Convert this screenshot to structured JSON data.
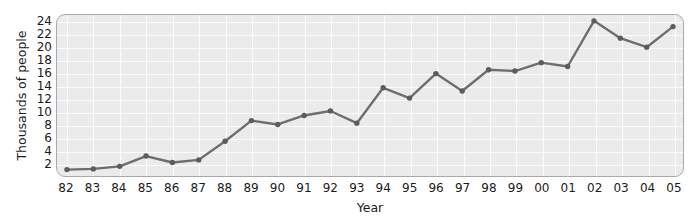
{
  "chart_data": {
    "type": "line",
    "title": "",
    "xlabel": "Year",
    "ylabel": "Thousands of people",
    "x_tick_labels": [
      "82",
      "83",
      "84",
      "85",
      "86",
      "87",
      "88",
      "89",
      "90",
      "91",
      "92",
      "93",
      "94",
      "95",
      "96",
      "97",
      "98",
      "99",
      "00",
      "01",
      "02",
      "03",
      "04",
      "05"
    ],
    "y_tick_labels": [
      "24",
      "22",
      "20",
      "18",
      "16",
      "14",
      "12",
      "10",
      "8",
      "6",
      "4",
      "2"
    ],
    "y_ticks": [
      24,
      22,
      20,
      18,
      16,
      14,
      12,
      10,
      8,
      6,
      4,
      2
    ],
    "ylim": [
      0,
      25
    ],
    "xlim": [
      0,
      23
    ],
    "grid": true,
    "legend": "none",
    "categories": [
      "82",
      "83",
      "84",
      "85",
      "86",
      "87",
      "88",
      "89",
      "90",
      "91",
      "92",
      "93",
      "94",
      "95",
      "96",
      "97",
      "98",
      "99",
      "00",
      "01",
      "02",
      "03",
      "04",
      "05"
    ],
    "values": [
      1.0,
      1.1,
      1.5,
      3.1,
      2.1,
      2.5,
      5.4,
      8.6,
      8.0,
      9.4,
      10.1,
      8.2,
      13.7,
      12.1,
      15.9,
      13.2,
      16.5,
      16.3,
      17.6,
      17.0,
      24.1,
      21.4,
      20.0,
      23.2
    ],
    "series": [
      {
        "name": "Thousands of people",
        "values": [
          1.0,
          1.1,
          1.5,
          3.1,
          2.1,
          2.5,
          5.4,
          8.6,
          8.0,
          9.4,
          10.1,
          8.2,
          13.7,
          12.1,
          15.9,
          13.2,
          16.5,
          16.3,
          17.6,
          17.0,
          24.1,
          21.4,
          20.0,
          23.2
        ],
        "color": "#6e6e6e",
        "marker": "circle"
      }
    ]
  },
  "style": {
    "plot_background": "#ebebeb",
    "gridline_color": "#fcfcfc",
    "border_color": "#a9a9a9",
    "line_color": "#6e6e6e",
    "marker_color": "#5c5c5c",
    "text_color": "#1b1b1b",
    "page_background": "#ffffff"
  }
}
